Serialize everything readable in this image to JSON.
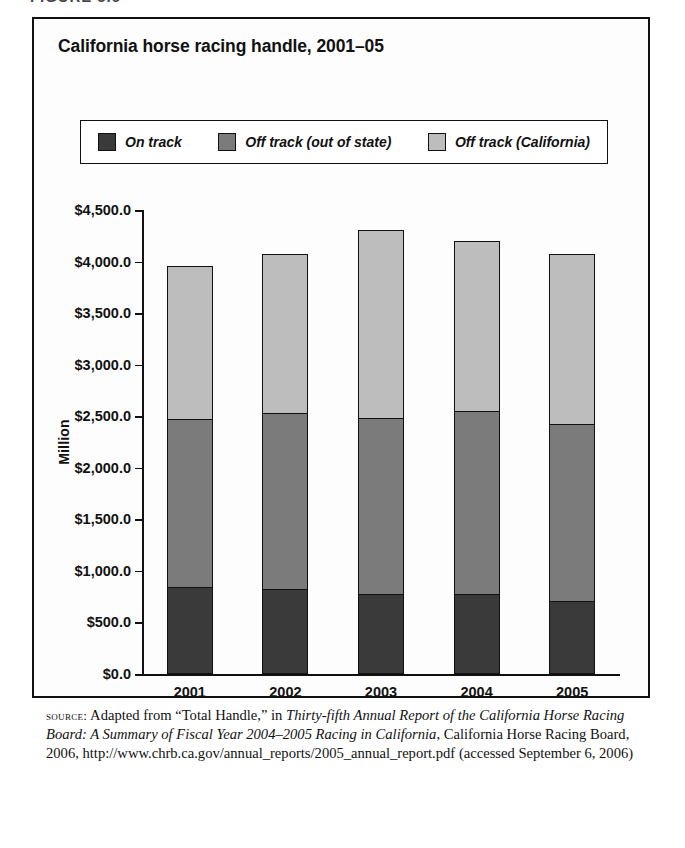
{
  "figure": {
    "label": "FIGURE 5.6"
  },
  "chart": {
    "title": "California horse racing handle, 2001–05",
    "axis_title": "Million",
    "legend": [
      {
        "label": "On track",
        "color": "#3a3a3a",
        "icon": "legend-swatch"
      },
      {
        "label": "Off track (out of state)",
        "color": "#7b7b7b",
        "icon": "legend-swatch"
      },
      {
        "label": "Off track (California)",
        "color": "#bdbdbd",
        "icon": "legend-swatch"
      }
    ]
  },
  "chart_data": {
    "type": "bar",
    "subtype": "stacked-vertical",
    "title": "California horse racing handle, 2001–05",
    "xlabel": "",
    "ylabel": "Million",
    "ylim": [
      0,
      4500
    ],
    "ytick_labels": [
      "$4,500.0",
      "$4,000.0",
      "$3,500.0",
      "$3,000.0",
      "$2,500.0",
      "$2,000.0",
      "$1,500.0",
      "$1,000.0",
      "$500.0",
      "$0.0"
    ],
    "ytick_values": [
      4500,
      4000,
      3500,
      3000,
      2500,
      2000,
      1500,
      1000,
      500,
      0
    ],
    "grid": false,
    "legend_position": "top",
    "categories": [
      "2001",
      "2002",
      "2003",
      "2004",
      "2005"
    ],
    "series": [
      {
        "name": "On track",
        "color": "#3a3a3a",
        "values": [
          845,
          825,
          780,
          780,
          710
        ]
      },
      {
        "name": "Off track (out of state)",
        "color": "#7b7b7b",
        "values": [
          1637,
          1715,
          1715,
          1785,
          1725
        ]
      },
      {
        "name": "Off track (California)",
        "color": "#bdbdbd",
        "values": [
          1503,
          1560,
          1840,
          1662,
          1665
        ]
      }
    ],
    "totals": [
      3985,
      4100,
      4335,
      4227,
      4100
    ]
  },
  "source": {
    "prefix": "source:",
    "line1_plain_a": " Adapted from “Total Handle,” in ",
    "line1_italic": "Thirty-fifth Annual Report of the California Horse Racing Board: A Summary of Fiscal Year 2004–2005 Racing in California",
    "line1_plain_b": ", California Horse Racing Board, 2006,",
    "url": "http://www.chrb.ca.gov/annual_reports/2005_annual_report.pdf",
    "accessed": "(accessed September 6, 2006)"
  }
}
